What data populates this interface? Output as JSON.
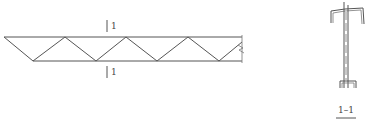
{
  "drawing": {
    "type": "truss-elevation-with-section",
    "elevation": {
      "section_mark_top": "1",
      "section_mark_bottom": "1",
      "top_chord_y": 37,
      "bottom_chord_y": 61,
      "top_nodes_x": [
        4,
        65,
        126,
        188
      ],
      "bottom_nodes_x": [
        33,
        96,
        157,
        219
      ],
      "end_x": 242
    },
    "section": {
      "label": "1–1"
    },
    "colors": {
      "line": "#555555",
      "background": "#ffffff"
    }
  }
}
